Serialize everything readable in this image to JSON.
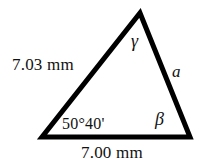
{
  "figure": {
    "kind": "geometry-triangle-diagram",
    "background_color": "#ffffff",
    "stroke_color": "#000000",
    "stroke_width": 5,
    "vertices": {
      "apex": [
        140,
        13
      ],
      "bottom_left": [
        42,
        137
      ],
      "bottom_right": [
        190,
        137
      ]
    }
  },
  "labels": {
    "side_left": "7.03 mm",
    "side_bottom": "7.00 mm",
    "side_right": "a",
    "angle_bottom_left": "50°40'",
    "angle_apex": "γ",
    "angle_bottom_right": "β"
  }
}
